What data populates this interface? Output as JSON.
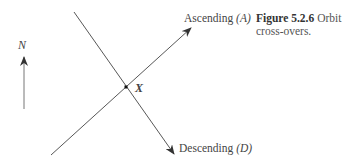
{
  "figure": {
    "caption_number": "Figure 5.2.6",
    "caption_text": "Orbit cross-overs.",
    "north_label": "N",
    "ascending_label": "Ascending",
    "ascending_symbol": "(A)",
    "descending_label": "Descending",
    "descending_symbol": "(D)",
    "crossover_label": "X"
  },
  "colors": {
    "line": "#444444",
    "text": "#444444"
  }
}
